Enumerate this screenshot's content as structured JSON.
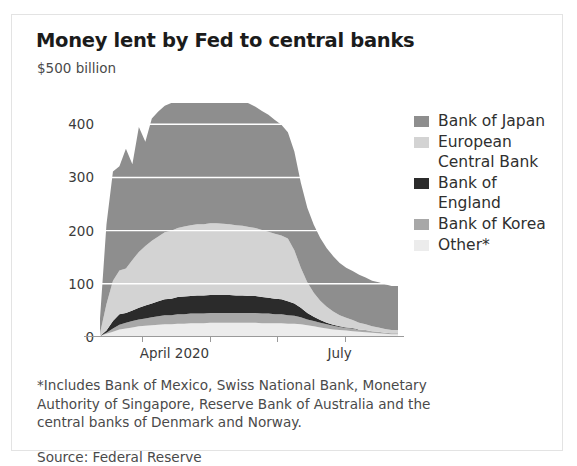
{
  "title": "Money lent by Fed to central banks",
  "unit": "$500 billion",
  "footnote": "*Includes Bank of Mexico, Swiss National Bank, Monetary Authority of Singapore, Reserve Bank of Australia and the central banks of Denmark and Norway.",
  "source": "Source: Federal Reserve",
  "colors": {
    "bank_of_japan": "#8e8e8e",
    "european_central_bank": "#d3d3d3",
    "bank_of_england": "#2b2b2b",
    "bank_of_korea": "#a8a8a8",
    "other": "#ececec",
    "gridline": "#ffffff",
    "axis": "#9a9a9a",
    "card_border": "#e3e3e3",
    "text": "#2f2f2f"
  },
  "legend": {
    "position": "right",
    "items": [
      {
        "label": "Bank of Japan",
        "swatch": "#8e8e8e",
        "key": "bank_of_japan"
      },
      {
        "label": "European Central Bank",
        "swatch": "#d3d3d3",
        "key": "european_central_bank"
      },
      {
        "label": "Bank of England",
        "swatch": "#2b2b2b",
        "key": "bank_of_england"
      },
      {
        "label": "Bank of Korea",
        "swatch": "#a8a8a8",
        "key": "bank_of_korea"
      },
      {
        "label": "Other*",
        "swatch": "#ececec",
        "key": "other"
      }
    ]
  },
  "chart_data": {
    "type": "area",
    "stacked": true,
    "title": "Money lent by Fed to central banks",
    "subtitle": "$500 billion",
    "xlabel": "",
    "ylabel": "$ billion",
    "ylim": [
      0,
      440
    ],
    "yticks": [
      0,
      100,
      200,
      300,
      400
    ],
    "ytick_labels": [
      "0",
      "100",
      "200",
      "300",
      "400"
    ],
    "grid": true,
    "xtick_labels": [
      "April 2020",
      "July"
    ],
    "xtick_label_positions": [
      0.16,
      0.79
    ],
    "xticks_count": 4,
    "x_start": "2020-03-20",
    "x_end": "2020-08-28",
    "x": [
      "2020-03-20",
      "2020-03-25",
      "2020-03-27",
      "2020-04-01",
      "2020-04-03",
      "2020-04-08",
      "2020-04-10",
      "2020-04-15",
      "2020-04-17",
      "2020-04-22",
      "2020-04-24",
      "2020-04-29",
      "2020-05-01",
      "2020-05-06",
      "2020-05-08",
      "2020-05-13",
      "2020-05-15",
      "2020-05-20",
      "2020-05-22",
      "2020-05-27",
      "2020-05-29",
      "2020-06-03",
      "2020-06-05",
      "2020-06-10",
      "2020-06-12",
      "2020-06-17",
      "2020-06-19",
      "2020-06-24",
      "2020-06-26",
      "2020-07-01",
      "2020-07-03",
      "2020-07-08",
      "2020-07-10",
      "2020-07-15",
      "2020-07-17",
      "2020-07-22",
      "2020-07-24",
      "2020-07-29",
      "2020-07-31",
      "2020-08-05",
      "2020-08-07",
      "2020-08-12",
      "2020-08-14",
      "2020-08-19",
      "2020-08-21",
      "2020-08-26",
      "2020-08-28"
    ],
    "series": [
      {
        "name": "Other*",
        "key": "other",
        "color": "#ececec",
        "values": [
          2,
          6,
          10,
          14,
          16,
          18,
          20,
          21,
          22,
          23,
          24,
          24,
          25,
          25,
          26,
          26,
          26,
          27,
          27,
          27,
          27,
          27,
          27,
          27,
          27,
          26,
          26,
          26,
          26,
          25,
          25,
          24,
          22,
          20,
          18,
          16,
          14,
          13,
          12,
          11,
          10,
          9,
          8,
          7,
          6,
          5,
          5
        ]
      },
      {
        "name": "Bank of Korea",
        "key": "bank_of_korea",
        "color": "#a8a8a8",
        "values": [
          0,
          2,
          6,
          9,
          11,
          12,
          13,
          14,
          15,
          16,
          17,
          17,
          18,
          18,
          18,
          18,
          18,
          18,
          18,
          18,
          18,
          18,
          18,
          18,
          18,
          18,
          18,
          17,
          17,
          16,
          15,
          13,
          11,
          10,
          9,
          8,
          7,
          6,
          5,
          5,
          4,
          4,
          3,
          3,
          2,
          2,
          2
        ]
      },
      {
        "name": "Bank of England",
        "key": "bank_of_england",
        "color": "#2b2b2b",
        "values": [
          0,
          4,
          14,
          20,
          18,
          20,
          22,
          24,
          26,
          28,
          30,
          31,
          32,
          33,
          33,
          34,
          34,
          34,
          34,
          34,
          34,
          33,
          33,
          32,
          32,
          31,
          30,
          29,
          28,
          26,
          23,
          18,
          12,
          8,
          5,
          3,
          2,
          1,
          1,
          1,
          0,
          0,
          0,
          0,
          0,
          0,
          0
        ]
      },
      {
        "name": "European Central Bank",
        "key": "european_central_bank",
        "color": "#d3d3d3",
        "values": [
          5,
          50,
          76,
          82,
          84,
          95,
          105,
          112,
          118,
          122,
          126,
          128,
          130,
          132,
          133,
          134,
          134,
          135,
          135,
          134,
          133,
          132,
          131,
          130,
          128,
          126,
          124,
          122,
          120,
          118,
          100,
          75,
          58,
          45,
          36,
          30,
          25,
          21,
          18,
          15,
          13,
          11,
          9,
          8,
          7,
          6,
          6
        ]
      },
      {
        "name": "Bank of Japan",
        "key": "bank_of_japan",
        "color": "#8e8e8e",
        "values": [
          28,
          150,
          205,
          196,
          225,
          180,
          235,
          196,
          230,
          235,
          238,
          240,
          242,
          244,
          245,
          246,
          246,
          245,
          244,
          243,
          242,
          240,
          236,
          232,
          228,
          224,
          220,
          214,
          208,
          200,
          186,
          160,
          140,
          128,
          118,
          110,
          104,
          98,
          94,
          92,
          90,
          88,
          86,
          85,
          84,
          83,
          83
        ]
      }
    ]
  }
}
